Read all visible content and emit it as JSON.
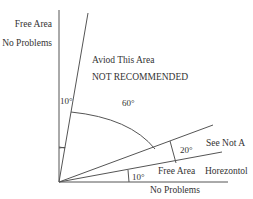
{
  "diagram": {
    "labels": {
      "free_area_top": "Free Area",
      "no_problems_top": "No Problems",
      "avoid_area": "Aviod This Area",
      "not_recommended": "NOT RECOMMENDED",
      "angle_10_vertical": "10°",
      "angle_60": "60°",
      "see_not_a": "See Not A",
      "angle_20": "20°",
      "free_area_bottom": "Free Area",
      "horizontal": "Horezontol",
      "angle_10_horizontal": "10°",
      "no_problems_bottom": "No Problems"
    },
    "angles_deg": {
      "vertical_zone": 10,
      "avoid_zone": 60,
      "see_not_a_zone": 20,
      "horizontal_zone": 10
    },
    "line_color": "#555555",
    "text_color": "#333333"
  }
}
